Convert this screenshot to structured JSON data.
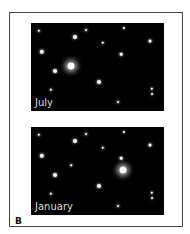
{
  "figure": {
    "letter": "B",
    "panels": [
      {
        "label": "July",
        "stars": [
          {
            "x": 8,
            "y": 8,
            "r": 1.2
          },
          {
            "x": 44,
            "y": 14,
            "r": 2
          },
          {
            "x": 55,
            "y": 7,
            "r": 1
          },
          {
            "x": 93,
            "y": 5,
            "r": 1.1
          },
          {
            "x": 72,
            "y": 20,
            "r": 1.2
          },
          {
            "x": 119,
            "y": 18,
            "r": 1.5
          },
          {
            "x": 11,
            "y": 29,
            "r": 2.2
          },
          {
            "x": 90,
            "y": 31,
            "r": 1.3
          },
          {
            "x": 24,
            "y": 48,
            "r": 2
          },
          {
            "x": 40,
            "y": 43,
            "r": 3.5,
            "glow": true
          },
          {
            "x": 68,
            "y": 59,
            "r": 2
          },
          {
            "x": 20,
            "y": 67,
            "r": 1.2
          },
          {
            "x": 121,
            "y": 66,
            "r": 1.2
          },
          {
            "x": 121,
            "y": 71,
            "r": 1
          },
          {
            "x": 87,
            "y": 79,
            "r": 1.1
          }
        ]
      },
      {
        "label": "January",
        "stars": [
          {
            "x": 8,
            "y": 8,
            "r": 1.2
          },
          {
            "x": 44,
            "y": 14,
            "r": 2
          },
          {
            "x": 55,
            "y": 7,
            "r": 1
          },
          {
            "x": 93,
            "y": 5,
            "r": 1.1
          },
          {
            "x": 72,
            "y": 21,
            "r": 1.2
          },
          {
            "x": 119,
            "y": 18,
            "r": 1.5
          },
          {
            "x": 11,
            "y": 29,
            "r": 2.2
          },
          {
            "x": 90,
            "y": 31,
            "r": 1.3
          },
          {
            "x": 24,
            "y": 48,
            "r": 2
          },
          {
            "x": 92,
            "y": 43,
            "r": 3.5,
            "glow": true
          },
          {
            "x": 68,
            "y": 59,
            "r": 2
          },
          {
            "x": 20,
            "y": 67,
            "r": 1.2
          },
          {
            "x": 121,
            "y": 66,
            "r": 1.2
          },
          {
            "x": 121,
            "y": 71,
            "r": 1
          },
          {
            "x": 87,
            "y": 79,
            "r": 1.1
          },
          {
            "x": 40,
            "y": 38,
            "r": 0.8
          }
        ]
      }
    ]
  }
}
